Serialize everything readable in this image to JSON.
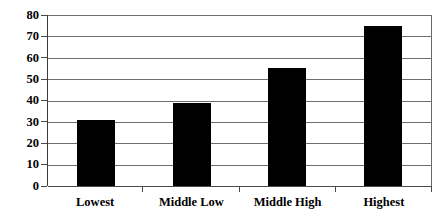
{
  "chart_data": {
    "type": "bar",
    "title": "",
    "subtitle": "",
    "xlabel": "",
    "ylabel": "",
    "categories": [
      "Lowest",
      "Middle Low",
      "Middle High",
      "Highest"
    ],
    "values": [
      31,
      39,
      55,
      75
    ],
    "series": [
      {
        "name": "",
        "values": [
          31,
          39,
          55,
          75
        ]
      }
    ],
    "ylim": [
      0,
      80
    ],
    "yticks": [
      0,
      10,
      20,
      30,
      40,
      50,
      60,
      70,
      80
    ],
    "ytick_labels": [
      "0",
      "10",
      "20",
      "30",
      "40",
      "50",
      "60",
      "70",
      "80"
    ],
    "grid": true,
    "grid_axis": "y",
    "legend": false,
    "legend_position": "none",
    "annotations": [],
    "bar_color": "#000000",
    "gridline_color": "#6e6e6e",
    "axis_color": "#3a3a3a",
    "background_color": "#ffffff"
  }
}
